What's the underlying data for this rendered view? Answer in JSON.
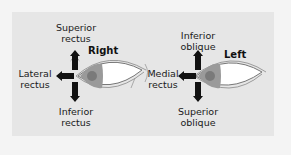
{
  "diagram": {
    "colors": {
      "background": "#f4f4f4",
      "panel": "#e6e6e6",
      "arrow": "#111111",
      "iris": "#9a9a9a",
      "pupil": "#7a7a7a",
      "sclera": "#ffffff"
    },
    "right_eye": {
      "label": "Right",
      "muscles": {
        "up": [
          "Superior",
          "rectus"
        ],
        "side": [
          "Lateral",
          "rectus"
        ],
        "down": [
          "Inferior",
          "rectus"
        ]
      }
    },
    "left_eye": {
      "label": "Left",
      "muscles": {
        "up": [
          "Inferior",
          "oblique"
        ],
        "side": [
          "Medial",
          "rectus"
        ],
        "down": [
          "Superior",
          "oblique"
        ]
      }
    }
  }
}
